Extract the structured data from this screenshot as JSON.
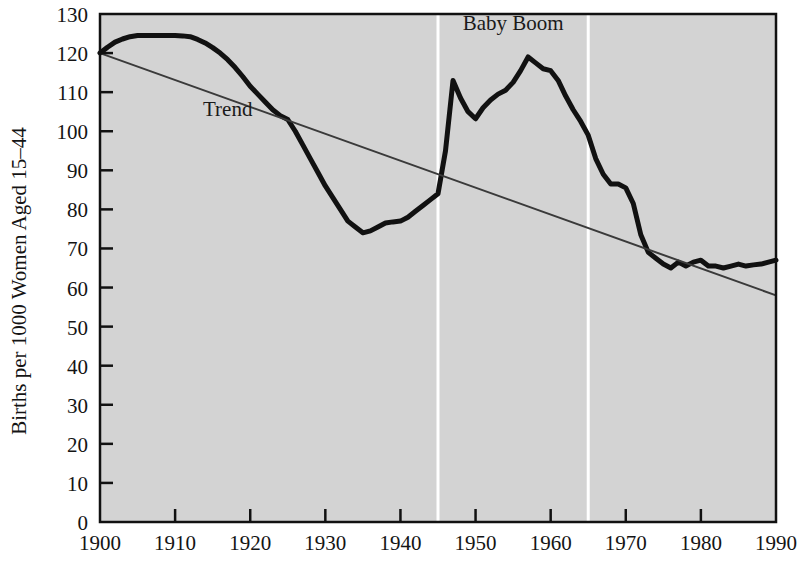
{
  "chart_data": {
    "type": "line",
    "title": "",
    "xlabel": "",
    "ylabel": "Births per 1000 Women Aged 15–44",
    "xlim": [
      1900,
      1990
    ],
    "ylim": [
      0,
      130
    ],
    "grid": false,
    "legend": "none",
    "plot_background_color": "#d3d3d3",
    "series": [
      {
        "name": "Birth rate",
        "color": "#111111",
        "line_width": 5,
        "x": [
          1900,
          1901,
          1902,
          1903,
          1904,
          1905,
          1906,
          1907,
          1908,
          1909,
          1910,
          1911,
          1912,
          1913,
          1914,
          1915,
          1916,
          1917,
          1918,
          1919,
          1920,
          1921,
          1922,
          1923,
          1924,
          1925,
          1926,
          1927,
          1928,
          1929,
          1930,
          1931,
          1932,
          1933,
          1934,
          1935,
          1936,
          1937,
          1938,
          1939,
          1940,
          1941,
          1942,
          1943,
          1944,
          1945,
          1946,
          1947,
          1948,
          1949,
          1950,
          1951,
          1952,
          1953,
          1954,
          1955,
          1956,
          1957,
          1958,
          1959,
          1960,
          1961,
          1962,
          1963,
          1964,
          1965,
          1966,
          1967,
          1968,
          1969,
          1970,
          1971,
          1972,
          1973,
          1974,
          1975,
          1976,
          1977,
          1978,
          1979,
          1980,
          1981,
          1982,
          1983,
          1984,
          1985,
          1986,
          1987,
          1988,
          1989,
          1990
        ],
        "y": [
          120.0,
          121.5,
          122.8,
          123.6,
          124.2,
          124.5,
          124.5,
          124.5,
          124.5,
          124.5,
          124.5,
          124.4,
          124.2,
          123.5,
          122.6,
          121.4,
          120.0,
          118.3,
          116.3,
          114.0,
          111.5,
          109.5,
          107.5,
          105.5,
          104.0,
          103.0,
          100.0,
          96.5,
          93.0,
          89.5,
          86.0,
          83.0,
          80.0,
          77.0,
          75.5,
          74.0,
          74.5,
          75.5,
          76.5,
          76.8,
          77.0,
          78.0,
          79.5,
          81.0,
          82.5,
          84.0,
          95.0,
          113.0,
          108.5,
          105.0,
          103.2,
          106.0,
          108.0,
          109.5,
          110.5,
          112.5,
          115.5,
          119.0,
          117.5,
          116.0,
          115.5,
          113.0,
          109.0,
          105.5,
          102.5,
          99.0,
          93.0,
          89.0,
          86.5,
          86.5,
          85.5,
          81.5,
          73.5,
          69.0,
          67.5,
          66.0,
          65.0,
          66.5,
          65.5,
          66.5,
          67.0,
          65.5,
          65.5,
          65.0,
          65.5,
          66.0,
          65.5,
          65.8,
          66.0,
          66.5,
          67.0
        ]
      },
      {
        "name": "Trend",
        "color": "#3a3a3a",
        "line_width": 2,
        "x": [
          1900,
          1990
        ],
        "y": [
          120.0,
          58.0
        ]
      }
    ],
    "y_ticks": [
      0,
      10,
      20,
      30,
      40,
      50,
      60,
      70,
      80,
      90,
      100,
      110,
      120,
      130
    ],
    "x_ticks": [
      1900,
      1910,
      1920,
      1930,
      1940,
      1950,
      1960,
      1970,
      1980,
      1990
    ],
    "annotations": [
      {
        "text": "Trend",
        "x": 1917,
        "y": 104,
        "name": "trend-label"
      },
      {
        "text": "Baby Boom",
        "x": 1955,
        "y": 126,
        "name": "baby-boom-label"
      }
    ],
    "marker_lines": [
      {
        "x": 1945,
        "color": "#ffffff",
        "name": "baby-boom-start-marker"
      },
      {
        "x": 1965,
        "color": "#ffffff",
        "name": "baby-boom-end-marker"
      }
    ]
  }
}
